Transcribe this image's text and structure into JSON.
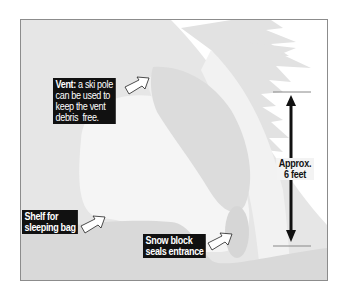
{
  "diagram": {
    "type": "snow-cave-cross-section",
    "colors": {
      "background": "#ffffff",
      "frame_border": "#8c8c8c",
      "snow_mound": "#e4e4e4",
      "interior": "#f4f4f4",
      "dark_snow": "#d6d6d6",
      "tree": "#e2e2e2",
      "label_bg": "#111111",
      "label_text": "#ffffff",
      "arrow": "#111111"
    },
    "callouts": {
      "vent": {
        "lead": "Vent:",
        "line1_rest": " a ski pole",
        "line2": "can be used to",
        "line3": "keep the vent",
        "line4": "debris  free."
      },
      "shelf": {
        "line1": "Shelf for",
        "line2": "sleeping bag"
      },
      "snow_block": {
        "line1": "Snow block",
        "line2": "seals entrance"
      }
    },
    "measurement": {
      "line1": "Approx.",
      "line2": "6 feet"
    }
  }
}
